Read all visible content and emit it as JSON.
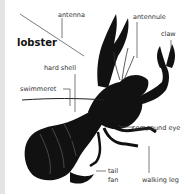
{
  "diagram": {
    "title": "lobster",
    "subject_icon": "lobster-illustration",
    "labels": {
      "antenna": "antenna",
      "antennule": "antennule",
      "claw": "claw",
      "hard_shell": "hard shell",
      "swimmeret": "swimmeret",
      "compound_eye": "compound eye",
      "tail_fan_line1": "tail",
      "tail_fan_line2": "fan",
      "walking_leg": "walking leg"
    },
    "colors": {
      "background": "#ffffff",
      "edge": "#e3e3e3",
      "body": "#111111",
      "label_text": "#333333",
      "leader_line": "#444444"
    }
  }
}
